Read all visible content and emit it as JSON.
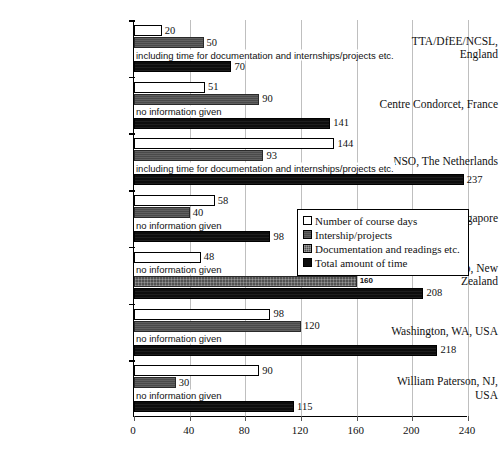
{
  "chart_data": {
    "type": "bar",
    "orientation": "horizontal",
    "title": "",
    "xlabel": "",
    "ylabel": "",
    "xlim": [
      0,
      240
    ],
    "xticks": [
      0,
      40,
      80,
      120,
      160,
      200,
      240
    ],
    "grid": true,
    "legend_position": "middle-right",
    "categories": [
      "TTA/DfEE/NCSL, England",
      "Centre Condorcet, France",
      "NSO, The Netherlands",
      "MOE/NIE, Singapore",
      "Uni Waikato, New Zealand",
      "Washington, WA, USA",
      "William Paterson, NJ, USA"
    ],
    "series": [
      {
        "name": "Number of course days",
        "key": "course",
        "color": "#ffffff",
        "values": [
          20,
          51,
          144,
          58,
          48,
          98,
          90
        ],
        "labels": [
          "20",
          "51",
          "144",
          "58",
          "48",
          "98",
          "90"
        ]
      },
      {
        "name": "Intership/projects",
        "key": "intern",
        "color": "#4a4a4a",
        "values": [
          50,
          90,
          93,
          40,
          null,
          120,
          30
        ],
        "labels": [
          "50",
          "90",
          "93",
          "40",
          "no information given",
          "120",
          "30"
        ]
      },
      {
        "name": "Documentation and readings etc.",
        "key": "docs",
        "color": "#525252",
        "values": [
          null,
          null,
          null,
          null,
          160,
          null,
          null
        ],
        "labels": [
          "including time for documentation and internships/projects etc.",
          "no information given",
          "including time for documentation and internships/projects etc.",
          "no information given",
          "160",
          "no information given",
          "no information given"
        ]
      },
      {
        "name": "Total amount of time",
        "key": "total",
        "color": "#0d0d0d",
        "values": [
          70,
          141,
          237,
          98,
          208,
          218,
          115
        ],
        "labels": [
          "70",
          "141",
          "237",
          "98",
          "208",
          "218",
          "115"
        ]
      }
    ]
  },
  "axis": {
    "x_tick_labels": [
      "0",
      "40",
      "80",
      "120",
      "160",
      "200",
      "240"
    ]
  },
  "categories": [
    {
      "lines": [
        "TTA/DfEE/NCSL,",
        "England"
      ]
    },
    {
      "lines": [
        "Centre Condorcet, France"
      ]
    },
    {
      "lines": [
        "NSO, The Netherlands"
      ]
    },
    {
      "lines": [
        "MOE/NIE, Singapore"
      ]
    },
    {
      "lines": [
        "Uni Waikato, New",
        "Zealand"
      ]
    },
    {
      "lines": [
        "Washington, WA, USA"
      ]
    },
    {
      "lines": [
        "William Paterson, NJ,",
        "USA"
      ]
    }
  ],
  "legend": {
    "items": [
      {
        "label": "Number of course days",
        "swatch": "course"
      },
      {
        "label": "Intership/projects",
        "swatch": "intern"
      },
      {
        "label": "Documentation and readings etc.",
        "swatch": "docs"
      },
      {
        "label": "Total amount of time",
        "swatch": "total"
      }
    ]
  }
}
